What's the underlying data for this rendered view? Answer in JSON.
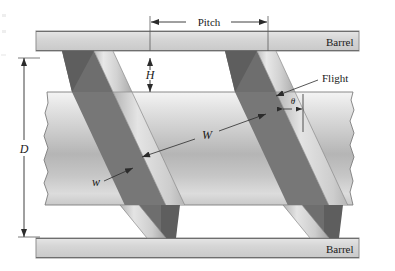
{
  "figure": {
    "type": "engineering-diagram"
  },
  "labels": {
    "barrel_top": "Barrel",
    "barrel_bottom": "Barrel",
    "pitch": "Pitch",
    "flight": "Flight",
    "channel_depth": "H",
    "screw_diameter": "D",
    "channel_width": "W",
    "flight_width": "w",
    "helix_angle": "θ"
  },
  "colors": {
    "background": "#ffffff",
    "barrel_fill": "#d4d4d4",
    "barrel_stroke": "#8a8a8a",
    "screw_light": "#f2f2f2",
    "screw_mid": "#bdbdbd",
    "screw_dark": "#a6a6a6",
    "flight_top": "#dedede",
    "flight_shadow": "#6f6f6f",
    "flight_shadow_dark": "#5f5f5f",
    "line": "#2b2b2b",
    "text": "#1a1a1a"
  },
  "geometry": {
    "canvas_width": 395,
    "canvas_height": 271,
    "barrel_top_y": 31,
    "barrel_top_height": 20,
    "barrel_bottom_y": 238,
    "barrel_bottom_height": 20,
    "screw_body_top_y": 92,
    "screw_body_bottom_y": 205,
    "pitch_start_x": 150,
    "pitch_end_x": 268,
    "pitch_dim_y": 22,
    "depth_dim_x": 150,
    "depth_dim_top_y": 58,
    "depth_dim_bottom_y": 92,
    "diameter_dim_x": 24,
    "diameter_dim_top_y": 58,
    "diameter_dim_bottom_y": 237,
    "helix_angle_degrees": 17.5
  },
  "annotations": {
    "pitch_description": "Axial distance between successive flights measured at the barrel wall",
    "H_description": "Channel depth between screw root and barrel inner surface",
    "D_description": "Screw outside diameter",
    "W_description": "Channel width measured perpendicular to the flight",
    "w_description": "Flight land width",
    "theta_description": "Helix angle of the flight relative to the plane normal to the screw axis"
  }
}
